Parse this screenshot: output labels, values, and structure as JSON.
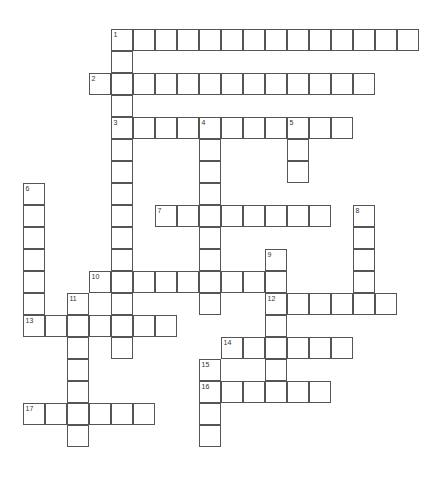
{
  "puzzle": {
    "cell_size": 22,
    "origin": {
      "x": 23,
      "y": 29
    },
    "line_color": "#555555",
    "entries": [
      {
        "number": 1,
        "direction": "across",
        "row": 0,
        "col": 4,
        "length": 14
      },
      {
        "number": 1,
        "direction": "down",
        "row": 0,
        "col": 4,
        "length": 15
      },
      {
        "number": 2,
        "direction": "across",
        "row": 2,
        "col": 3,
        "length": 13
      },
      {
        "number": 3,
        "direction": "across",
        "row": 4,
        "col": 4,
        "length": 11
      },
      {
        "number": 4,
        "direction": "down",
        "row": 4,
        "col": 8,
        "length": 9
      },
      {
        "number": 5,
        "direction": "down",
        "row": 4,
        "col": 12,
        "length": 3
      },
      {
        "number": 6,
        "direction": "down",
        "row": 7,
        "col": 0,
        "length": 7
      },
      {
        "number": 7,
        "direction": "across",
        "row": 8,
        "col": 6,
        "length": 8
      },
      {
        "number": 8,
        "direction": "down",
        "row": 8,
        "col": 15,
        "length": 5
      },
      {
        "number": 9,
        "direction": "down",
        "row": 10,
        "col": 11,
        "length": 7
      },
      {
        "number": 10,
        "direction": "across",
        "row": 11,
        "col": 3,
        "length": 9
      },
      {
        "number": 11,
        "direction": "down",
        "row": 12,
        "col": 2,
        "length": 7
      },
      {
        "number": 12,
        "direction": "across",
        "row": 12,
        "col": 11,
        "length": 6
      },
      {
        "number": 13,
        "direction": "across",
        "row": 13,
        "col": 0,
        "length": 7
      },
      {
        "number": 14,
        "direction": "across",
        "row": 14,
        "col": 9,
        "length": 6
      },
      {
        "number": 15,
        "direction": "down",
        "row": 15,
        "col": 8,
        "length": 4
      },
      {
        "number": 16,
        "direction": "across",
        "row": 16,
        "col": 8,
        "length": 6
      },
      {
        "number": 17,
        "direction": "across",
        "row": 17,
        "col": 0,
        "length": 6
      }
    ]
  }
}
